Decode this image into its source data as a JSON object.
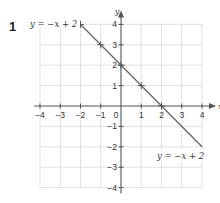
{
  "question": {
    "number": "1"
  },
  "chart_data": {
    "type": "line",
    "title": "",
    "xlabel": "x",
    "ylabel": "y",
    "xlim": [
      -4,
      4
    ],
    "ylim": [
      -4,
      4
    ],
    "grid": true,
    "x_ticks": [
      "−4",
      "−3",
      "−2",
      "−1",
      "0",
      "1",
      "2",
      "3",
      "4"
    ],
    "y_ticks": [
      "4",
      "3",
      "2",
      "1",
      "−1",
      "−2",
      "−3",
      "−4"
    ],
    "series": [
      {
        "name": "y = −x + 2",
        "equation": "y = −x + 2",
        "line_range_x": [
          -2.3,
          4
        ],
        "marked_points": [
          {
            "x": -2,
            "y": 4
          },
          {
            "x": -1,
            "y": 3
          },
          {
            "x": 0,
            "y": 2
          },
          {
            "x": 1,
            "y": 1
          },
          {
            "x": 2,
            "y": 0
          }
        ]
      }
    ],
    "annotations": [
      {
        "text": "y = −x + 2",
        "position": "top-left, at point (-2, 4)"
      },
      {
        "text": "y = −x + 2",
        "position": "bottom-right, near (3, -2)"
      }
    ]
  },
  "labels": {
    "top_eq": "y = −x + 2",
    "bottom_eq": "y = −x + 2",
    "x_axis": "x",
    "y_axis": "y"
  },
  "colors": {
    "grid": "#d9d9d9",
    "axis": "#555555",
    "line": "#666666"
  }
}
